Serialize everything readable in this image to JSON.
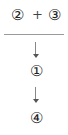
{
  "expression": {
    "left_operand": "②",
    "operator": "+",
    "right_operand": "③"
  },
  "steps": [
    {
      "symbol": "①"
    },
    {
      "symbol": "④"
    }
  ],
  "colors": {
    "text": "#222222",
    "line": "#9a9a9a",
    "arrow": "#666666"
  }
}
